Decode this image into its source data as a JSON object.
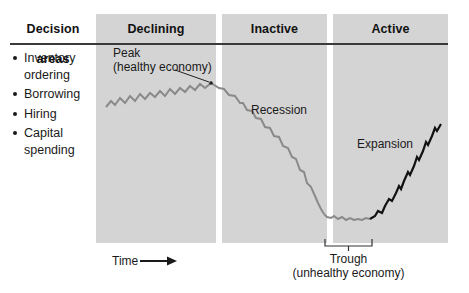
{
  "figure": {
    "colors": {
      "panel_gray": "#d4d4d4",
      "rule_dark": "#3a3a3a",
      "curve_gray": "#8a8a8a",
      "curve_black": "#111111",
      "text": "#1a1a1a",
      "background": "#ffffff"
    }
  },
  "headers": {
    "decision": "Decision areas",
    "declining": "Declining",
    "inactive": "Inactive",
    "active": "Active"
  },
  "decision_areas": {
    "heading": "Decision areas",
    "items": [
      "Inventory ordering",
      "Borrowing",
      "Hiring",
      "Capital spending"
    ]
  },
  "annotations": {
    "peak_line1": "Peak",
    "peak_line2": "(healthy economy)",
    "recession": "Recession",
    "expansion": "Expansion",
    "trough_line1": "Trough",
    "trough_line2": "(unhealthy economy)",
    "time": "Time"
  },
  "chart_data": {
    "type": "line",
    "xlabel": "Time",
    "ylabel": "",
    "grid": false,
    "legend": "none",
    "phases": [
      {
        "name": "Declining",
        "x_start": 96,
        "x_end": 216
      },
      {
        "name": "Inactive",
        "x_start": 222,
        "x_end": 327
      },
      {
        "name": "Active",
        "x_start": 333,
        "x_end": 448
      }
    ],
    "series": [
      {
        "name": "Declining rise to peak",
        "color": "#8a8a8a",
        "points": "106,107 111,101 115,105 120,98 125,103 130,96 135,101 140,94 145,99 150,93 155,97 160,91 165,96 170,89 175,94 180,88 185,92 190,86 195,90 200,84 205,88 211,83"
      },
      {
        "name": "Recession decline",
        "color": "#8a8a8a",
        "points": "211,83 219,88 224,89 229,95 235,96 240,103 243,103 247,110 252,111 256,118 261,119 265,127 270,128 274,136 279,137 283,146 288,148 292,157 296,159 300,170 304,172 307,183 311,187 315,196 318,203 321,209 324,214"
      },
      {
        "name": "Trough flat",
        "color": "#8a8a8a",
        "points": "324,214 327,217 331,218 334,216 338,219 342,217 346,220 350,218 354,220 358,219 362,220 366,218 370,219"
      },
      {
        "name": "Expansion rise",
        "color": "#111111",
        "points": "370,219 375,216 378,211 382,213 385,206 389,199 392,201 396,193 399,186 401,189 404,181 408,172 410,175 414,166 417,157 419,160 423,151 426,142 428,145 432,136 435,128 437,131 441,124"
      }
    ],
    "markers": [
      {
        "name": "peak",
        "x": 211,
        "y": 83,
        "label": "Peak (healthy economy)"
      }
    ],
    "brackets": [
      {
        "name": "trough",
        "x_start": 325,
        "x_end": 372,
        "y": 245,
        "label": "Trough (unhealthy economy)"
      }
    ]
  }
}
